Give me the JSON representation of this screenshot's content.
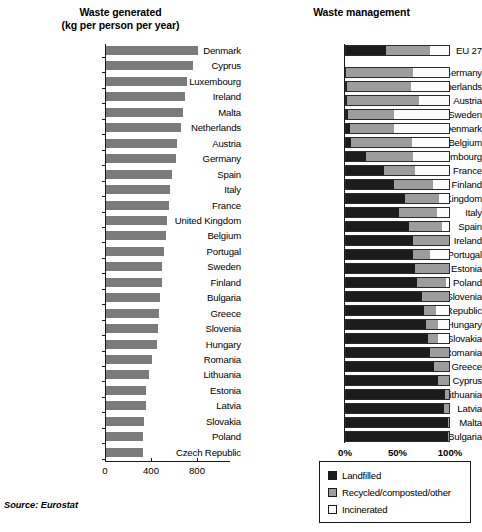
{
  "source_note": "Source: Eurostat",
  "legend": {
    "items": [
      {
        "label": "Landfilled",
        "color": "#1c1c1c",
        "key": "landfilled"
      },
      {
        "label": "Recycled/composted/other",
        "color": "#9d9d9d",
        "key": "recycled"
      },
      {
        "label": "Incinerated",
        "color": "#fbfbfb",
        "key": "incinerated"
      }
    ]
  },
  "chart_data": [
    {
      "type": "bar",
      "id": "waste-generated",
      "title": "Waste generated",
      "subtitle": "(kg per person per year)",
      "orientation": "horizontal",
      "xlabel": "",
      "ylabel": "",
      "xlim": [
        0,
        900
      ],
      "grid": false,
      "bar_color": "#7b7b7b",
      "tick_labels": [
        "0",
        "400",
        "800"
      ],
      "ticks": [
        0,
        400,
        800
      ],
      "categories": [
        "Denmark",
        "Cyprus",
        "Luxembourg",
        "Ireland",
        "Malta",
        "Netherlands",
        "Austria",
        "Germany",
        "Spain",
        "Italy",
        "France",
        "United Kingdom",
        "Belgium",
        "Portugal",
        "Sweden",
        "Finland",
        "Bulgaria",
        "Greece",
        "Slovenia",
        "Hungary",
        "Romania",
        "Lithuania",
        "Estonia",
        "Latvia",
        "Slovakia",
        "Poland",
        "Czech Republic"
      ],
      "values": [
        800,
        760,
        700,
        690,
        670,
        650,
        620,
        610,
        570,
        560,
        550,
        530,
        520,
        500,
        490,
        490,
        470,
        460,
        450,
        440,
        400,
        370,
        350,
        350,
        330,
        320,
        320
      ]
    },
    {
      "type": "bar",
      "id": "waste-management",
      "title": "Waste management",
      "orientation": "horizontal",
      "stacked": true,
      "normalized": true,
      "xlabel": "",
      "ylabel": "",
      "xlim": [
        0,
        100
      ],
      "grid": false,
      "tick_labels": [
        "0%",
        "50%",
        "100%"
      ],
      "ticks": [
        0,
        50,
        100
      ],
      "series": [
        {
          "name": "Landfilled",
          "color": "#1c1c1c"
        },
        {
          "name": "Recycled/composted/other",
          "color": "#9d9d9d"
        },
        {
          "name": "Incinerated",
          "color": "#fbfbfb"
        }
      ],
      "categories": [
        "EU 27",
        "Germany",
        "Netherlands",
        "Austria",
        "Sweden",
        "Denmark",
        "Belgium",
        "Luxembourg",
        "France",
        "Finland",
        "United Kingdom",
        "Italy",
        "Spain",
        "Ireland",
        "Portugal",
        "Estonia",
        "Poland",
        "Slovenia",
        "Czech Republic",
        "Hungary",
        "Slovakia",
        "Romania",
        "Greece",
        "Cyprus",
        "Lithuania",
        "Latvia",
        "Malta",
        "Bulgaria"
      ],
      "gap_after": [
        "EU 27"
      ],
      "rows": [
        {
          "category": "EU 27",
          "landfilled": 38,
          "recycled": 42,
          "incinerated": 20
        },
        {
          "category": "Germany",
          "landfilled": 0,
          "recycled": 64,
          "incinerated": 36
        },
        {
          "category": "Netherlands",
          "landfilled": 1,
          "recycled": 61,
          "incinerated": 38
        },
        {
          "category": "Austria",
          "landfilled": 1,
          "recycled": 69,
          "incinerated": 30
        },
        {
          "category": "Sweden",
          "landfilled": 2,
          "recycled": 44,
          "incinerated": 54
        },
        {
          "category": "Denmark",
          "landfilled": 4,
          "recycled": 42,
          "incinerated": 54
        },
        {
          "category": "Belgium",
          "landfilled": 5,
          "recycled": 58,
          "incinerated": 37
        },
        {
          "category": "Luxembourg",
          "landfilled": 19,
          "recycled": 45,
          "incinerated": 36
        },
        {
          "category": "France",
          "landfilled": 36,
          "recycled": 30,
          "incinerated": 34
        },
        {
          "category": "Finland",
          "landfilled": 46,
          "recycled": 37,
          "incinerated": 17
        },
        {
          "category": "United Kingdom",
          "landfilled": 56,
          "recycled": 33,
          "incinerated": 11
        },
        {
          "category": "Italy",
          "landfilled": 50,
          "recycled": 37,
          "incinerated": 13
        },
        {
          "category": "Spain",
          "landfilled": 60,
          "recycled": 31,
          "incinerated": 9
        },
        {
          "category": "Ireland",
          "landfilled": 64,
          "recycled": 34,
          "incinerated": 2
        },
        {
          "category": "Portugal",
          "landfilled": 64,
          "recycled": 16,
          "incinerated": 20
        },
        {
          "category": "Estonia",
          "landfilled": 66,
          "recycled": 34,
          "incinerated": 0
        },
        {
          "category": "Poland",
          "landfilled": 68,
          "recycled": 27,
          "incinerated": 5
        },
        {
          "category": "Slovenia",
          "landfilled": 72,
          "recycled": 28,
          "incinerated": 0
        },
        {
          "category": "Czech Republic",
          "landfilled": 74,
          "recycled": 12,
          "incinerated": 14
        },
        {
          "category": "Hungary",
          "landfilled": 76,
          "recycled": 12,
          "incinerated": 12
        },
        {
          "category": "Slovakia",
          "landfilled": 78,
          "recycled": 10,
          "incinerated": 12
        },
        {
          "category": "Romania",
          "landfilled": 80,
          "recycled": 20,
          "incinerated": 0
        },
        {
          "category": "Greece",
          "landfilled": 84,
          "recycled": 16,
          "incinerated": 0
        },
        {
          "category": "Cyprus",
          "landfilled": 88,
          "recycled": 12,
          "incinerated": 0
        },
        {
          "category": "Lithuania",
          "landfilled": 94,
          "recycled": 6,
          "incinerated": 0
        },
        {
          "category": "Latvia",
          "landfilled": 93,
          "recycled": 7,
          "incinerated": 0
        },
        {
          "category": "Malta",
          "landfilled": 97,
          "recycled": 3,
          "incinerated": 0
        },
        {
          "category": "Bulgaria",
          "landfilled": 97,
          "recycled": 3,
          "incinerated": 0
        }
      ]
    }
  ]
}
